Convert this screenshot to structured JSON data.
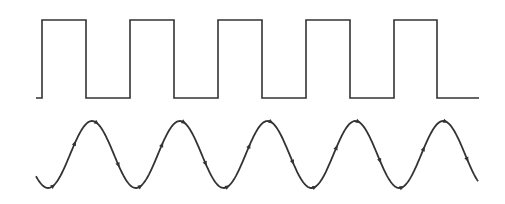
{
  "diagram": {
    "stroke_color": "#333333",
    "background": "#ffffff",
    "square_wave": {
      "start_x": 36,
      "end_x": 479,
      "high_y": 20,
      "low_y": 98,
      "transitions_x": [
        42,
        86,
        130,
        174,
        218,
        262,
        306,
        350,
        394,
        437
      ]
    },
    "sine_wave": {
      "start_x": 36,
      "end_x": 478,
      "peak_y": 121,
      "trough_y": 188,
      "period": 87.8,
      "first_peak_x": 92,
      "peaks_x": [
        92,
        180,
        267,
        355,
        443
      ],
      "direction_arrows": 20
    }
  }
}
